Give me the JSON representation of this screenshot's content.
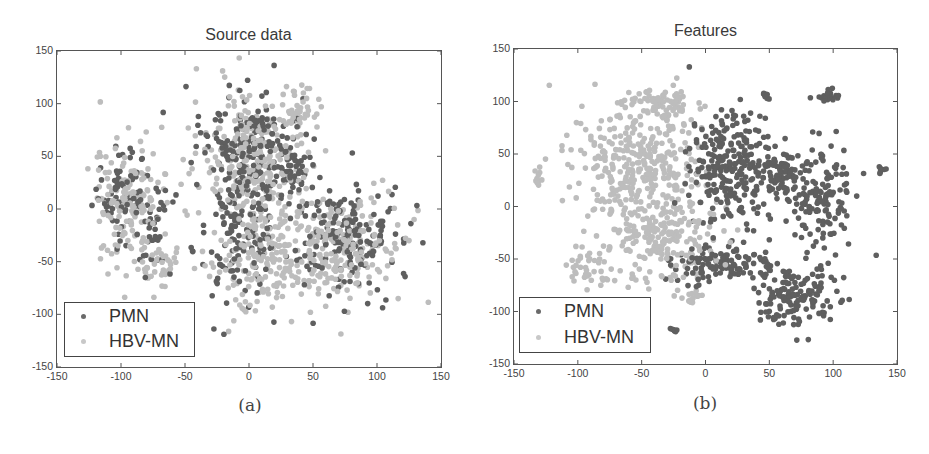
{
  "colors": {
    "PMN": "#5f5f5f",
    "HBV-MN": "#bdbdbd",
    "axis": "#555555",
    "text": "#333333"
  },
  "chart_data": [
    {
      "type": "scatter",
      "title": "Source data",
      "caption": "(a)",
      "xlabel": "",
      "ylabel": "",
      "xlim": [
        -150,
        150
      ],
      "ylim": [
        -150,
        150
      ],
      "xticks": [
        "-150",
        "-100",
        "-50",
        "0",
        "50",
        "100",
        "150"
      ],
      "yticks": [
        "150",
        "100",
        "50",
        "0",
        "-50",
        "-100",
        "-150"
      ],
      "grid": false,
      "legend": {
        "position": "lower-left",
        "entries": [
          "PMN",
          "HBV-MN"
        ]
      },
      "series": [
        {
          "name": "PMN",
          "color": "#5f5f5f",
          "marker": "dot",
          "clusters": [
            {
              "cx": -100,
              "cy": 15,
              "rx": 20,
              "ry": 40,
              "n": 70
            },
            {
              "cx": -75,
              "cy": -25,
              "rx": 12,
              "ry": 30,
              "n": 30
            },
            {
              "cx": 0,
              "cy": 60,
              "rx": 35,
              "ry": 50,
              "n": 180
            },
            {
              "cx": -10,
              "cy": -20,
              "rx": 30,
              "ry": 60,
              "n": 140
            },
            {
              "cx": 75,
              "cy": -25,
              "rx": 40,
              "ry": 45,
              "n": 170
            },
            {
              "cx": 35,
              "cy": 30,
              "rx": 15,
              "ry": 25,
              "n": 50
            }
          ]
        },
        {
          "name": "HBV-MN",
          "color": "#bdbdbd",
          "marker": "dot",
          "clusters": [
            {
              "cx": -95,
              "cy": 5,
              "rx": 25,
              "ry": 50,
              "n": 150
            },
            {
              "cx": -70,
              "cy": -55,
              "rx": 15,
              "ry": 20,
              "n": 40
            },
            {
              "cx": 5,
              "cy": 45,
              "rx": 40,
              "ry": 65,
              "n": 260
            },
            {
              "cx": 40,
              "cy": 95,
              "rx": 12,
              "ry": 20,
              "n": 40
            },
            {
              "cx": 10,
              "cy": -50,
              "rx": 40,
              "ry": 40,
              "n": 160
            },
            {
              "cx": 70,
              "cy": -35,
              "rx": 45,
              "ry": 45,
              "n": 230
            }
          ]
        }
      ]
    },
    {
      "type": "scatter",
      "title": "Features",
      "caption": "(b)",
      "xlabel": "",
      "ylabel": "",
      "xlim": [
        -150,
        150
      ],
      "ylim": [
        -150,
        150
      ],
      "xticks": [
        "-150",
        "-100",
        "-50",
        "0",
        "50",
        "100",
        "150"
      ],
      "yticks": [
        "150",
        "100",
        "50",
        "0",
        "-50",
        "-100",
        "-150"
      ],
      "grid": false,
      "legend": {
        "position": "lower-left",
        "entries": [
          "PMN",
          "HBV-MN"
        ]
      },
      "series": [
        {
          "name": "PMN",
          "color": "#5f5f5f",
          "marker": "dot",
          "clusters": [
            {
              "cx": 20,
              "cy": 35,
              "rx": 30,
              "ry": 50,
              "n": 260
            },
            {
              "cx": 10,
              "cy": -55,
              "rx": 35,
              "ry": 15,
              "n": 110
            },
            {
              "cx": 70,
              "cy": -85,
              "rx": 30,
              "ry": 25,
              "n": 150
            },
            {
              "cx": 90,
              "cy": 10,
              "rx": 25,
              "ry": 45,
              "n": 150
            },
            {
              "cx": 95,
              "cy": 105,
              "rx": 7,
              "ry": 5,
              "n": 20
            },
            {
              "cx": 48,
              "cy": 105,
              "rx": 4,
              "ry": 3,
              "n": 8
            },
            {
              "cx": 138,
              "cy": 35,
              "rx": 3,
              "ry": 4,
              "n": 8
            },
            {
              "cx": -25,
              "cy": -118,
              "rx": 4,
              "ry": 3,
              "n": 8
            },
            {
              "cx": 60,
              "cy": 30,
              "rx": 15,
              "ry": 20,
              "n": 60
            }
          ]
        },
        {
          "name": "HBV-MN",
          "color": "#bdbdbd",
          "marker": "dot",
          "clusters": [
            {
              "cx": -55,
              "cy": 40,
              "rx": 45,
              "ry": 55,
              "n": 330
            },
            {
              "cx": -35,
              "cy": -30,
              "rx": 40,
              "ry": 40,
              "n": 200
            },
            {
              "cx": -30,
              "cy": 95,
              "rx": 25,
              "ry": 15,
              "n": 60
            },
            {
              "cx": -130,
              "cy": 30,
              "rx": 4,
              "ry": 8,
              "n": 10
            },
            {
              "cx": -90,
              "cy": -55,
              "rx": 15,
              "ry": 20,
              "n": 40
            },
            {
              "cx": -10,
              "cy": -85,
              "rx": 6,
              "ry": 6,
              "n": 15
            }
          ]
        }
      ]
    }
  ]
}
